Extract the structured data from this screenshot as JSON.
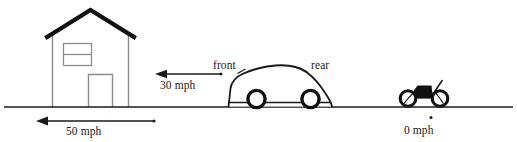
{
  "diagram": {
    "background_color": "#ffffff",
    "line_color": "#1a1a1a",
    "wall_color": "#8c8c8c",
    "ground": {
      "name": "ground-line",
      "x1": 4,
      "x2": 513,
      "y": 107
    },
    "objects": [
      {
        "key": "house",
        "label": "house",
        "velocity_label": "50 mph",
        "direction": "left"
      },
      {
        "key": "car",
        "label": "car",
        "velocity_label": "30 mph",
        "direction": "left",
        "front_label": "front",
        "rear_label": "rear"
      },
      {
        "key": "motorcycle",
        "label": "motorcycle",
        "velocity_label": "0 mph",
        "direction": "none"
      }
    ],
    "labels": {
      "speed_house": "50 mph",
      "speed_car": "30 mph",
      "speed_motorcycle": "0 mph",
      "car_front": "front",
      "car_rear": "rear"
    }
  }
}
